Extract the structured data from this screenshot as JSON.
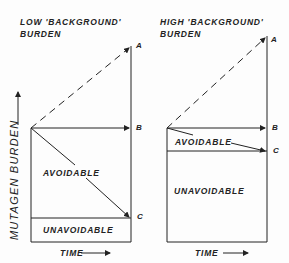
{
  "panels": [
    {
      "title_line1": "LOW 'BACKGROUND'",
      "title_line2": "BURDEN",
      "region_avoidable": "AVOIDABLE",
      "region_unavoidable": "UNAVOIDABLE",
      "points": {
        "A": "A",
        "B": "B",
        "C": "C"
      },
      "xlabel": "TIME"
    },
    {
      "title_line1": "HIGH 'BACKGROUND'",
      "title_line2": "BURDEN",
      "region_avoidable": "AVOIDABLE",
      "region_unavoidable": "UNAVOIDABLE",
      "points": {
        "A": "A",
        "B": "B",
        "C": "C"
      },
      "xlabel": "TIME"
    }
  ],
  "ylabel": "MUTAGEN  BURDEN",
  "colors": {
    "line": "#222222",
    "background": "#fdfdfd"
  }
}
